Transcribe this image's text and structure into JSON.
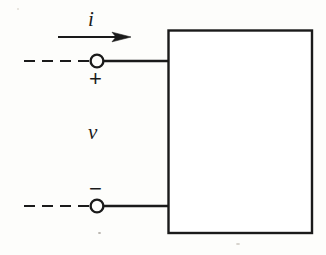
{
  "figure": {
    "kind": "circuit-diagram",
    "width": 326,
    "height": 255,
    "background_color": "#fdfdfb",
    "ink_color": "#1a1a1a",
    "stroke_width": 2
  },
  "labels": {
    "current": "i",
    "voltage": "v",
    "plus": "+",
    "minus": "−"
  },
  "geometry": {
    "box": {
      "x": 168,
      "y": 30,
      "width": 144,
      "height": 203,
      "fill": "#ffffff",
      "stroke": "#1a1a1a",
      "stroke_width": 2.4
    },
    "top_terminal": {
      "circle_cx": 97,
      "circle_cy": 61,
      "circle_r": 6.5,
      "wire_x1": 104,
      "wire_x2": 169,
      "wire_y": 61
    },
    "bottom_terminal": {
      "circle_cx": 97,
      "circle_cy": 206,
      "circle_r": 6.5,
      "wire_x1": 104,
      "wire_x2": 169,
      "wire_y": 206
    },
    "top_dashed_lead": {
      "x1": 24,
      "x2": 90,
      "y": 61,
      "dash_pattern": "11 7"
    },
    "bottom_dashed_lead": {
      "x1": 24,
      "x2": 90,
      "y": 206,
      "dash_pattern": "11 7"
    },
    "current_arrow": {
      "x1": 58,
      "x2": 131,
      "y": 37,
      "head_length": 16,
      "head_half_width": 5
    }
  },
  "elements": {
    "box_name": "black-box-element",
    "top_terminal_name": "positive-terminal",
    "bottom_terminal_name": "negative-terminal",
    "arrow_name": "current-direction-arrow"
  }
}
